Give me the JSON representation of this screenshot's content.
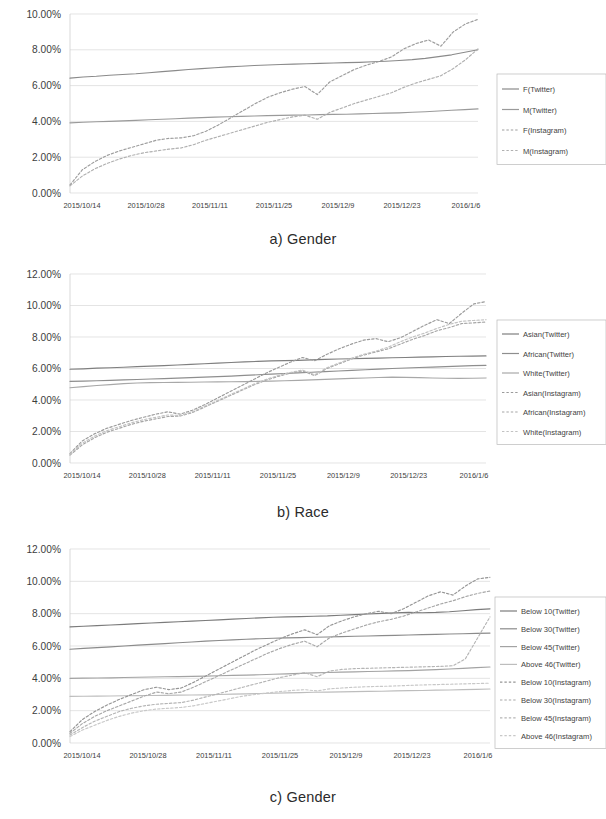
{
  "figure": {
    "charts": [
      {
        "id": "gender",
        "caption": "a) Gender",
        "ylabels": [
          "0.00%",
          "2.00%",
          "4.00%",
          "6.00%",
          "8.00%",
          "10.00%"
        ],
        "ylim": [
          0,
          10
        ],
        "ystep": 2,
        "xlabels": [
          "2015/10/14",
          "2015/10/28",
          "2015/11/11",
          "2015/11/25",
          "2015/12/9",
          "2015/12/23",
          "2016/1/6"
        ],
        "legend": [
          "F(Twitter)",
          "M(Twitter)",
          "F(Instagram)",
          "M(Instagram)"
        ]
      },
      {
        "id": "race",
        "caption": "b) Race",
        "ylabels": [
          "0.00%",
          "2.00%",
          "4.00%",
          "6.00%",
          "8.00%",
          "10.00%",
          "12.00%"
        ],
        "ylim": [
          0,
          12
        ],
        "ystep": 2,
        "xlabels": [
          "2015/10/14",
          "2015/10/28",
          "2015/11/11",
          "2015/11/25",
          "2015/12/9",
          "2015/12/23",
          "2016/1/6"
        ],
        "legend": [
          "Asian(Twitter)",
          "African(Twitter)",
          "White(Twitter)",
          "Asian(Instagram)",
          "African(Instagram)",
          "White(Instagram)"
        ]
      },
      {
        "id": "age",
        "caption": "c) Gender",
        "ylabels": [
          "0.00%",
          "2.00%",
          "4.00%",
          "6.00%",
          "8.00%",
          "10.00%",
          "12.00%"
        ],
        "ylim": [
          0,
          12
        ],
        "ystep": 2,
        "xlabels": [
          "2015/10/14",
          "2015/10/28",
          "2015/11/11",
          "2015/11/25",
          "2015/12/9",
          "2015/12/23",
          "2016/1/6"
        ],
        "legend": [
          "Below 10(Twitter)",
          "Below 30(Twitter)",
          "Below 45(Twitter)",
          "Above 46(Twitter)",
          "Below 10(Instagram)",
          "Below 30(Instagram)",
          "Below 45(Instagram)",
          "Above 46(Instagram)"
        ]
      }
    ]
  },
  "chart_data": [
    {
      "type": "line",
      "title": "a) Gender",
      "xlabel": "",
      "ylabel": "",
      "ylim": [
        0,
        10
      ],
      "yticks": [
        0,
        2,
        4,
        6,
        8,
        10
      ],
      "ytick_labels": [
        "0.00%",
        "2.00%",
        "4.00%",
        "6.00%",
        "8.00%",
        "10.00%"
      ],
      "x": [
        "2015/10/14",
        "2015/10/28",
        "2015/11/11",
        "2015/11/25",
        "2015/12/9",
        "2015/12/23",
        "2016/1/6"
      ],
      "grid": true,
      "legend_position": "right",
      "series": [
        {
          "name": "F(Twitter)",
          "style": "solid",
          "color": "#8a8a8a",
          "values": [
            6.42,
            6.48,
            6.52,
            6.58,
            6.62,
            6.66,
            6.72,
            6.78,
            6.84,
            6.9,
            6.95,
            7.0,
            7.05,
            7.08,
            7.12,
            7.15,
            7.18,
            7.2,
            7.22,
            7.24,
            7.26,
            7.28,
            7.3,
            7.33,
            7.36,
            7.4,
            7.45,
            7.52,
            7.62,
            7.72,
            7.86,
            8.0
          ]
        },
        {
          "name": "M(Twitter)",
          "style": "solid",
          "color": "#9a9a9a",
          "values": [
            3.92,
            3.95,
            3.98,
            4.0,
            4.03,
            4.06,
            4.09,
            4.12,
            4.15,
            4.18,
            4.21,
            4.24,
            4.26,
            4.28,
            4.3,
            4.32,
            4.34,
            4.35,
            4.36,
            4.38,
            4.39,
            4.4,
            4.42,
            4.44,
            4.46,
            4.48,
            4.51,
            4.54,
            4.58,
            4.62,
            4.66,
            4.7
          ]
        },
        {
          "name": "F(Instagram)",
          "style": "dashed",
          "color": "#9d9d9d",
          "values": [
            0.45,
            1.3,
            1.75,
            2.1,
            2.35,
            2.55,
            2.75,
            2.95,
            3.05,
            3.08,
            3.2,
            3.45,
            3.8,
            4.2,
            4.6,
            5.0,
            5.35,
            5.6,
            5.8,
            5.95,
            5.5,
            6.2,
            6.55,
            6.9,
            7.15,
            7.35,
            7.6,
            8.05,
            8.35,
            8.55,
            8.2,
            9.0,
            9.45,
            9.7
          ]
        },
        {
          "name": "M(Instagram)",
          "style": "dashed",
          "color": "#b0b0b0",
          "values": [
            0.4,
            0.95,
            1.35,
            1.65,
            1.9,
            2.1,
            2.25,
            2.35,
            2.45,
            2.52,
            2.7,
            2.95,
            3.15,
            3.35,
            3.55,
            3.75,
            3.95,
            4.1,
            4.25,
            4.35,
            4.12,
            4.5,
            4.75,
            5.0,
            5.2,
            5.4,
            5.6,
            5.9,
            6.15,
            6.35,
            6.55,
            6.95,
            7.45,
            8.05
          ]
        }
      ]
    },
    {
      "type": "line",
      "title": "b) Race",
      "xlabel": "",
      "ylabel": "",
      "ylim": [
        0,
        12
      ],
      "yticks": [
        0,
        2,
        4,
        6,
        8,
        10,
        12
      ],
      "ytick_labels": [
        "0.00%",
        "2.00%",
        "4.00%",
        "6.00%",
        "8.00%",
        "10.00%",
        "12.00%"
      ],
      "x": [
        "2015/10/14",
        "2015/10/28",
        "2015/11/11",
        "2015/11/25",
        "2015/12/9",
        "2015/12/23",
        "2016/1/6"
      ],
      "grid": true,
      "legend_position": "right",
      "series": [
        {
          "name": "Asian(Twitter)",
          "style": "solid",
          "color": "#7f7f7f",
          "values": [
            5.95,
            5.98,
            6.02,
            6.05,
            6.08,
            6.12,
            6.15,
            6.18,
            6.22,
            6.26,
            6.3,
            6.34,
            6.38,
            6.42,
            6.45,
            6.48,
            6.5,
            6.52,
            6.55,
            6.58,
            6.6,
            6.62,
            6.64,
            6.66,
            6.68,
            6.7,
            6.72,
            6.74,
            6.76,
            6.78,
            6.79,
            6.8
          ]
        },
        {
          "name": "African(Twitter)",
          "style": "solid",
          "color": "#8e8e8e",
          "values": [
            5.18,
            5.2,
            5.22,
            5.25,
            5.28,
            5.3,
            5.33,
            5.36,
            5.39,
            5.42,
            5.45,
            5.48,
            5.52,
            5.56,
            5.6,
            5.64,
            5.68,
            5.72,
            5.76,
            5.8,
            5.84,
            5.88,
            5.92,
            5.96,
            6.0,
            6.03,
            6.06,
            6.09,
            6.12,
            6.15,
            6.18,
            6.2
          ]
        },
        {
          "name": "White(Twitter)",
          "style": "solid",
          "color": "#a8a8a8",
          "values": [
            4.78,
            4.85,
            4.92,
            4.98,
            5.04,
            5.08,
            5.1,
            5.11,
            5.12,
            5.13,
            5.14,
            5.15,
            5.16,
            5.17,
            5.18,
            5.2,
            5.22,
            5.25,
            5.28,
            5.31,
            5.34,
            5.37,
            5.4,
            5.43,
            5.45,
            5.44,
            5.42,
            5.4,
            5.38,
            5.37,
            5.38,
            5.4
          ]
        },
        {
          "name": "Asian(Instagram)",
          "style": "dashed",
          "color": "#9b9b9b",
          "values": [
            0.6,
            1.4,
            1.85,
            2.2,
            2.45,
            2.7,
            2.9,
            3.1,
            3.25,
            3.1,
            3.35,
            3.7,
            4.1,
            4.5,
            4.9,
            5.3,
            5.7,
            6.05,
            6.4,
            6.7,
            6.5,
            6.9,
            7.25,
            7.55,
            7.8,
            7.9,
            7.7,
            7.95,
            8.35,
            8.75,
            9.1,
            8.85,
            9.5,
            10.1,
            10.25
          ]
        },
        {
          "name": "African(Instagram)",
          "style": "dashed",
          "color": "#a5a5a5",
          "values": [
            0.5,
            1.15,
            1.6,
            1.95,
            2.2,
            2.45,
            2.65,
            2.8,
            2.95,
            2.98,
            3.2,
            3.55,
            3.9,
            4.25,
            4.6,
            4.95,
            5.25,
            5.5,
            5.7,
            5.85,
            5.55,
            6.0,
            6.3,
            6.6,
            6.85,
            7.05,
            7.25,
            7.55,
            7.85,
            8.1,
            8.4,
            8.6,
            8.85,
            8.9,
            8.95
          ]
        },
        {
          "name": "White(Instagram)",
          "style": "dashed",
          "color": "#c2c2c2",
          "values": [
            0.55,
            1.25,
            1.7,
            2.05,
            2.3,
            2.55,
            2.75,
            2.9,
            3.05,
            3.02,
            3.25,
            3.6,
            3.95,
            4.3,
            4.65,
            5.0,
            5.3,
            5.55,
            5.75,
            5.9,
            5.6,
            6.05,
            6.35,
            6.65,
            6.9,
            7.1,
            7.35,
            7.7,
            8.0,
            8.25,
            8.55,
            8.8,
            9.0,
            9.05,
            9.1
          ]
        }
      ]
    },
    {
      "type": "line",
      "title": "c) Gender",
      "xlabel": "",
      "ylabel": "",
      "ylim": [
        0,
        12
      ],
      "yticks": [
        0,
        2,
        4,
        6,
        8,
        10,
        12
      ],
      "ytick_labels": [
        "0.00%",
        "2.00%",
        "4.00%",
        "6.00%",
        "8.00%",
        "10.00%",
        "12.00%"
      ],
      "x": [
        "2015/10/14",
        "2015/10/28",
        "2015/11/11",
        "2015/11/25",
        "2015/12/9",
        "2015/12/23",
        "2016/1/6"
      ],
      "grid": true,
      "legend_position": "right",
      "series": [
        {
          "name": "Below 10(Twitter)",
          "style": "solid",
          "color": "#7b7b7b",
          "values": [
            7.18,
            7.22,
            7.26,
            7.3,
            7.34,
            7.38,
            7.42,
            7.46,
            7.5,
            7.54,
            7.58,
            7.62,
            7.66,
            7.7,
            7.74,
            7.78,
            7.8,
            7.82,
            7.84,
            7.86,
            7.9,
            7.94,
            7.98,
            8.02,
            8.05,
            8.08,
            8.06,
            8.08,
            8.12,
            8.18,
            8.25,
            8.3
          ]
        },
        {
          "name": "Below 30(Twitter)",
          "style": "solid",
          "color": "#8b8b8b",
          "values": [
            5.8,
            5.85,
            5.9,
            5.95,
            6.0,
            6.05,
            6.1,
            6.15,
            6.2,
            6.25,
            6.3,
            6.34,
            6.38,
            6.42,
            6.45,
            6.48,
            6.5,
            6.52,
            6.54,
            6.56,
            6.58,
            6.6,
            6.62,
            6.64,
            6.66,
            6.68,
            6.7,
            6.72,
            6.74,
            6.76,
            6.78,
            6.8
          ]
        },
        {
          "name": "Below 45(Twitter)",
          "style": "solid",
          "color": "#a3a3a3",
          "values": [
            4.0,
            4.01,
            4.02,
            4.03,
            4.05,
            4.07,
            4.08,
            4.1,
            4.11,
            4.12,
            4.14,
            4.16,
            4.18,
            4.2,
            4.22,
            4.25,
            4.28,
            4.31,
            4.34,
            4.36,
            4.38,
            4.4,
            4.42,
            4.44,
            4.46,
            4.48,
            4.51,
            4.54,
            4.58,
            4.62,
            4.66,
            4.7
          ]
        },
        {
          "name": "Above 46(Twitter)",
          "style": "solid",
          "color": "#bdbdbd",
          "values": [
            2.88,
            2.89,
            2.9,
            2.91,
            2.92,
            2.93,
            2.94,
            2.95,
            2.96,
            2.97,
            2.98,
            3.0,
            3.02,
            3.04,
            3.06,
            3.08,
            3.1,
            3.12,
            3.14,
            3.15,
            3.16,
            3.18,
            3.19,
            3.2,
            3.22,
            3.24,
            3.25,
            3.27,
            3.28,
            3.3,
            3.32,
            3.34
          ]
        },
        {
          "name": "Below 10(Instagram)",
          "style": "dashed",
          "color": "#959595",
          "values": [
            0.7,
            1.45,
            1.95,
            2.35,
            2.7,
            3.0,
            3.3,
            3.45,
            3.3,
            3.4,
            3.75,
            4.15,
            4.55,
            4.95,
            5.35,
            5.75,
            6.1,
            6.45,
            6.75,
            7.0,
            6.7,
            7.25,
            7.55,
            7.8,
            8.0,
            8.15,
            8.0,
            8.3,
            8.7,
            9.1,
            9.35,
            9.15,
            9.7,
            10.15,
            10.25
          ]
        },
        {
          "name": "Below 30(Instagram)",
          "style": "dashed",
          "color": "#a7a7a7",
          "values": [
            0.6,
            1.2,
            1.65,
            2.0,
            2.3,
            2.6,
            2.9,
            3.15,
            3.05,
            3.15,
            3.45,
            3.8,
            4.15,
            4.5,
            4.85,
            5.2,
            5.55,
            5.85,
            6.1,
            6.3,
            5.95,
            6.5,
            6.8,
            7.05,
            7.3,
            7.5,
            7.65,
            7.85,
            8.1,
            8.35,
            8.6,
            8.8,
            9.05,
            9.25,
            9.4
          ]
        },
        {
          "name": "Below 45(Instagram)",
          "style": "dashed",
          "color": "#b5b5b5",
          "values": [
            0.5,
            0.95,
            1.35,
            1.65,
            1.95,
            2.15,
            2.3,
            2.4,
            2.45,
            2.5,
            2.65,
            2.85,
            3.05,
            3.25,
            3.45,
            3.65,
            3.85,
            4.05,
            4.2,
            4.35,
            4.1,
            4.45,
            4.55,
            4.6,
            4.62,
            4.64,
            4.66,
            4.68,
            4.7,
            4.72,
            4.74,
            4.78,
            5.2,
            6.5,
            7.8
          ]
        },
        {
          "name": "Above 46(Instagram)",
          "style": "dashed",
          "color": "#c8c8c8",
          "values": [
            0.4,
            0.8,
            1.1,
            1.4,
            1.65,
            1.85,
            2.0,
            2.1,
            2.15,
            2.2,
            2.3,
            2.45,
            2.6,
            2.75,
            2.9,
            3.0,
            3.1,
            3.18,
            3.25,
            3.3,
            3.22,
            3.35,
            3.4,
            3.45,
            3.48,
            3.5,
            3.52,
            3.55,
            3.58,
            3.6,
            3.62,
            3.64,
            3.66,
            3.68,
            3.7
          ]
        }
      ]
    }
  ]
}
